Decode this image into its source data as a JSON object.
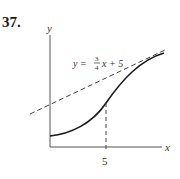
{
  "problem": {
    "number": "37."
  },
  "diagram": {
    "axes": {
      "x_label": "x",
      "y_label": "y"
    },
    "tangent_line": {
      "equation_prefix": "y =",
      "slope_numerator": "3",
      "slope_denominator": "4",
      "equation_suffix": "x + 5",
      "style": "dashed"
    },
    "marked_point": {
      "x_tick_label": "5"
    },
    "curve": {
      "description": "increasing curve, tangent to dashed line at x = 5"
    },
    "colors": {
      "ink": "#1a1a1a",
      "axis": "#555555",
      "dash": "#444444"
    }
  }
}
